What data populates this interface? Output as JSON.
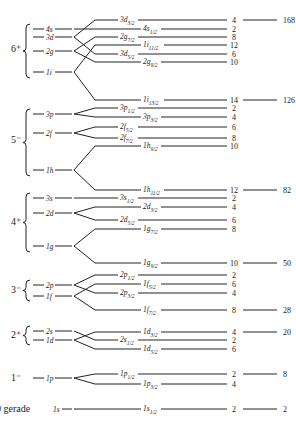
{
  "colors": {
    "ink": "#222222",
    "background": "#ffffff"
  },
  "groups": [
    {
      "label": "6⁺",
      "y_top": 24,
      "y_bottom": 78,
      "label_y": 52,
      "levels": [
        {
          "name": "4s",
          "y": 29
        },
        {
          "name": "3d",
          "y": 37
        },
        {
          "name": "2g",
          "y": 51
        },
        {
          "name": "1i",
          "y": 72
        }
      ]
    },
    {
      "label": "5⁻",
      "y_top": 109,
      "y_bottom": 176,
      "label_y": 143,
      "levels": [
        {
          "name": "3p",
          "y": 114
        },
        {
          "name": "2f",
          "y": 133
        },
        {
          "name": "1h",
          "y": 170
        }
      ]
    },
    {
      "label": "4⁺",
      "y_top": 193,
      "y_bottom": 252,
      "label_y": 225,
      "levels": [
        {
          "name": "3s",
          "y": 198
        },
        {
          "name": "2d",
          "y": 213
        },
        {
          "name": "1g",
          "y": 246
        }
      ]
    },
    {
      "label": "3⁻",
      "y_top": 280,
      "y_bottom": 301,
      "label_y": 293,
      "levels": [
        {
          "name": "2p",
          "y": 285
        },
        {
          "name": "1f",
          "y": 296
        }
      ]
    },
    {
      "label": "2⁺",
      "y_top": 326,
      "y_bottom": 345,
      "label_y": 338,
      "levels": [
        {
          "name": "2s",
          "y": 331
        },
        {
          "name": "1d",
          "y": 340
        }
      ]
    },
    {
      "label": "1⁻",
      "y_top": null,
      "y_bottom": null,
      "label_y": 381,
      "levels": [
        {
          "name": "1p",
          "y": 378
        }
      ]
    },
    {
      "label": "0 gerade",
      "y_top": null,
      "y_bottom": null,
      "label_y": 412,
      "levels": [
        {
          "name": "1s",
          "y": 409
        }
      ]
    }
  ],
  "split_levels": [
    {
      "parent": "3d",
      "name": "3d",
      "j": "3/2",
      "degeneracy": "4",
      "y": 20,
      "label_x": 120
    },
    {
      "parent": "4s",
      "name": "4s",
      "j": "1/2",
      "degeneracy": "2",
      "y": 29,
      "label_x": 143
    },
    {
      "parent": "2g",
      "name": "2g",
      "j": "7/2",
      "degeneracy": "8",
      "y": 37,
      "label_x": 120
    },
    {
      "parent": "1i",
      "name": "1i",
      "j": "11/2",
      "degeneracy": "12",
      "y": 45,
      "label_x": 143
    },
    {
      "parent": "3d",
      "name": "3d",
      "j": "5/2",
      "degeneracy": "6",
      "y": 54,
      "label_x": 120
    },
    {
      "parent": "2g",
      "name": "2g",
      "j": "9/2",
      "degeneracy": "10",
      "y": 62,
      "label_x": 143
    },
    {
      "parent": "1i",
      "name": "1i",
      "j": "13/2",
      "degeneracy": "14",
      "y": 100,
      "label_x": 143
    },
    {
      "parent": "3p",
      "name": "3p",
      "j": "1/2",
      "degeneracy": "2",
      "y": 108,
      "label_x": 120
    },
    {
      "parent": "3p",
      "name": "3p",
      "j": "3/2",
      "degeneracy": "4",
      "y": 117,
      "label_x": 143
    },
    {
      "parent": "2f",
      "name": "2f",
      "j": "5/2",
      "degeneracy": "6",
      "y": 127,
      "label_x": 120
    },
    {
      "parent": "2f",
      "name": "2f",
      "j": "7/2",
      "degeneracy": "8",
      "y": 138,
      "label_x": 120
    },
    {
      "parent": "1h",
      "name": "1h",
      "j": "9/2",
      "degeneracy": "10",
      "y": 146,
      "label_x": 143
    },
    {
      "parent": "1h",
      "name": "1h",
      "j": "11/2",
      "degeneracy": "12",
      "y": 190,
      "label_x": 143
    },
    {
      "parent": "3s",
      "name": "3s",
      "j": "1/2",
      "degeneracy": "2",
      "y": 198,
      "label_x": 120
    },
    {
      "parent": "2d",
      "name": "2d",
      "j": "3/2",
      "degeneracy": "4",
      "y": 207,
      "label_x": 143
    },
    {
      "parent": "2d",
      "name": "2d",
      "j": "5/2",
      "degeneracy": "6",
      "y": 220,
      "label_x": 120
    },
    {
      "parent": "1g",
      "name": "1g",
      "j": "7/2",
      "degeneracy": "8",
      "y": 229,
      "label_x": 143
    },
    {
      "parent": "1g",
      "name": "1g",
      "j": "9/2",
      "degeneracy": "10",
      "y": 263,
      "label_x": 143
    },
    {
      "parent": "2p",
      "name": "2p",
      "j": "1/2",
      "degeneracy": "2",
      "y": 275,
      "label_x": 120
    },
    {
      "parent": "1f",
      "name": "1f",
      "j": "5/2",
      "degeneracy": "6",
      "y": 284,
      "label_x": 143
    },
    {
      "parent": "2p",
      "name": "2p",
      "j": "3/2",
      "degeneracy": "4",
      "y": 293,
      "label_x": 120
    },
    {
      "parent": "1f",
      "name": "1f",
      "j": "7/2",
      "degeneracy": "8",
      "y": 310,
      "label_x": 143
    },
    {
      "parent": "1d",
      "name": "1d",
      "j": "3/2",
      "degeneracy": "4",
      "y": 332,
      "label_x": 143
    },
    {
      "parent": "2s",
      "name": "2s",
      "j": "1/2",
      "degeneracy": "2",
      "y": 340,
      "label_x": 120
    },
    {
      "parent": "1d",
      "name": "1d",
      "j": "5/2",
      "degeneracy": "6",
      "y": 349,
      "label_x": 143
    },
    {
      "parent": "1p",
      "name": "1p",
      "j": "1/2",
      "degeneracy": "2",
      "y": 374,
      "label_x": 120
    },
    {
      "parent": "1p",
      "name": "1p",
      "j": "3/2",
      "degeneracy": "4",
      "y": 384,
      "label_x": 143
    },
    {
      "parent": "1s",
      "name": "1s",
      "j": "1/2",
      "degeneracy": "2",
      "y": 409,
      "label_x": 143
    }
  ],
  "magic_numbers": [
    {
      "value": "168",
      "y": 20
    },
    {
      "value": "126",
      "y": 100
    },
    {
      "value": "82",
      "y": 190
    },
    {
      "value": "50",
      "y": 263
    },
    {
      "value": "28",
      "y": 310
    },
    {
      "value": "20",
      "y": 332
    },
    {
      "value": "8",
      "y": 374
    },
    {
      "value": "2",
      "y": 409
    }
  ]
}
